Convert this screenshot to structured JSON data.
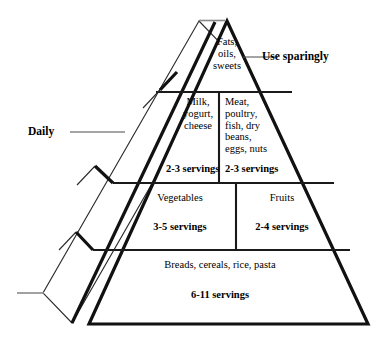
{
  "diagram": {
    "name": "food-guide-pyramid",
    "ink_color": "#111111",
    "background_color": "#ffffff",
    "tick_color": "#8a8a8a"
  },
  "callouts": {
    "use_sparingly": "Use sparingly",
    "daily": "Daily"
  },
  "tiers": [
    {
      "level": 1,
      "name": "fats-oils-sweets",
      "groups": [
        {
          "name": "fats-oils-sweets",
          "food": "Fats,\noils,\nsweets",
          "servings": ""
        }
      ]
    },
    {
      "level": 2,
      "name": "milk-and-meat",
      "groups": [
        {
          "name": "milk-yogurt-cheese",
          "food": "Milk,\nyogurt,\ncheese",
          "servings": "2-3 servings"
        },
        {
          "name": "meat-poultry-fish",
          "food": "Meat,\npoultry,\nfish, dry\nbeans,\neggs, nuts",
          "servings": "2-3 servings"
        }
      ]
    },
    {
      "level": 3,
      "name": "vegetables-and-fruits",
      "groups": [
        {
          "name": "vegetables",
          "food": "Vegetables",
          "servings": "3-5 servings"
        },
        {
          "name": "fruits",
          "food": "Fruits",
          "servings": "2-4 servings"
        }
      ]
    },
    {
      "level": 4,
      "name": "breads-cereals-rice-pasta",
      "groups": [
        {
          "name": "breads-cereals-rice-pasta",
          "food": "Breads, cereals, rice, pasta",
          "servings": "6-11 servings"
        }
      ]
    }
  ]
}
